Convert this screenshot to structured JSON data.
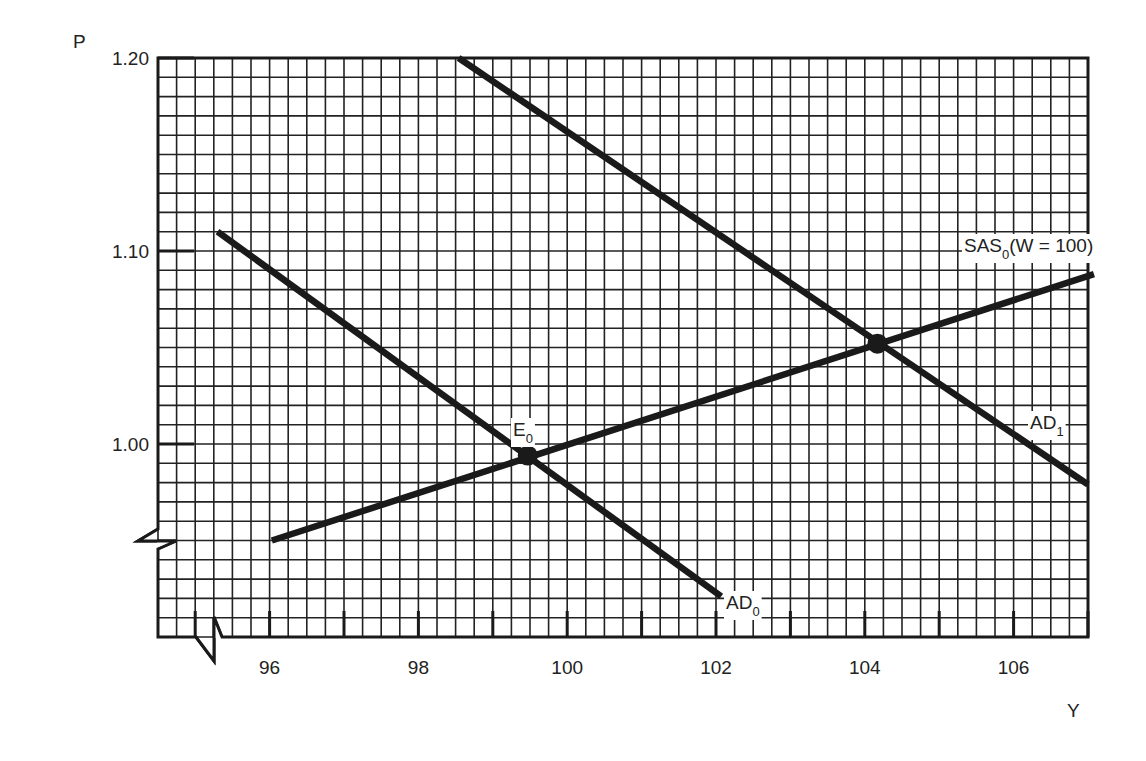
{
  "chart_data": {
    "type": "line",
    "title": "",
    "xlabel": "Y",
    "ylabel": "P",
    "xlim": [
      94.5,
      107.0
    ],
    "ylim": [
      0.9,
      1.2
    ],
    "x_ticks": [
      96,
      98,
      100,
      102,
      104,
      106
    ],
    "x_tick_labels": [
      "96",
      "98",
      "100",
      "102",
      "104",
      "106"
    ],
    "y_ticks": [
      1.2,
      1.1,
      1.0
    ],
    "y_tick_labels": [
      "1.20",
      "1.10",
      "1.00"
    ],
    "grid": true,
    "grid_minor_x": 0.25,
    "grid_minor_y": 0.01,
    "axis_breaks": [
      "x",
      "y"
    ],
    "series": [
      {
        "name": "AD0",
        "label": "AD",
        "subscript": "0",
        "x": [
          95.3,
          102.07
        ],
        "y": [
          1.11,
          0.921
        ]
      },
      {
        "name": "SAS0 (W = 100)",
        "label": "SAS",
        "subscript": "0",
        "suffix": "(W = 100)",
        "x": [
          96.03,
          107.08
        ],
        "y": [
          0.95,
          1.088
        ]
      },
      {
        "name": "AD1",
        "label": "AD",
        "subscript": "1",
        "x": [
          98.54,
          107.0
        ],
        "y": [
          1.2,
          0.979
        ]
      }
    ],
    "points": [
      {
        "name": "E0",
        "label": "E",
        "subscript": "0",
        "x": 99.47,
        "y": 0.994
      },
      {
        "name": "E1",
        "label": "",
        "subscript": "",
        "x": 104.17,
        "y": 1.052
      }
    ],
    "annotations": [
      {
        "text": "SAS0(W = 100)",
        "near": "upper right of SAS0"
      },
      {
        "text": "AD1",
        "near": "lower right of AD1"
      },
      {
        "text": "AD0",
        "near": "end of AD0"
      },
      {
        "text": "E0",
        "near": "AD0/SAS0 intersection"
      }
    ],
    "legend": null,
    "colors": {
      "line": "#1a1a1a",
      "grid": "#222222",
      "background": "#ffffff"
    }
  }
}
